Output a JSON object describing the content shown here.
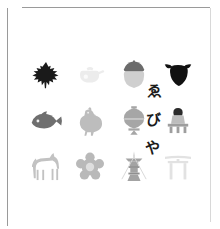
{
  "card": {
    "background_color": "#ffffff",
    "rule_color": "#9a9a9a",
    "rule_color_light": "#d8d8d8"
  },
  "wordmark": {
    "name": "ebiya-wordmark",
    "orientation": "vertical",
    "text": "ゑびや",
    "characters": [
      "ゑ",
      "び",
      "や"
    ],
    "color": "#1b1b1b"
  },
  "grid": {
    "columns": 4,
    "rows": 3,
    "cells": [
      {
        "icon": "maple-leaf-icon",
        "label": "もみじ",
        "color": "#1a1a1a"
      },
      {
        "icon": "teapot-icon",
        "label": "急須",
        "color": "#ececec"
      },
      {
        "icon": "acorn-icon",
        "label": "どんぐり",
        "color": "#9b9b9b"
      },
      {
        "icon": "cow-head-icon",
        "label": "牛",
        "color": "#111111"
      },
      {
        "icon": "sea-bream-fish-icon",
        "label": "鯛",
        "color": "#6f6f6f"
      },
      {
        "icon": "rooster-icon",
        "label": "鶏",
        "color": "#bdbdbd"
      },
      {
        "icon": "lantern-icon",
        "label": "提灯",
        "color": "#a6a6a6"
      },
      {
        "icon": "kokeshi-doll-icon",
        "label": "こけし",
        "color": "#b2b2b2"
      },
      {
        "icon": "horse-icon",
        "label": "馬",
        "color": "#c2c2c2"
      },
      {
        "icon": "chrysanthemum-icon",
        "label": "菊",
        "color": "#b9b9b9"
      },
      {
        "icon": "lantern-stand-icon",
        "label": "灯籠",
        "color": "#a3a3a3"
      },
      {
        "icon": "torii-gate-icon",
        "label": "鳥居",
        "color": "#e2e2e2"
      }
    ]
  }
}
